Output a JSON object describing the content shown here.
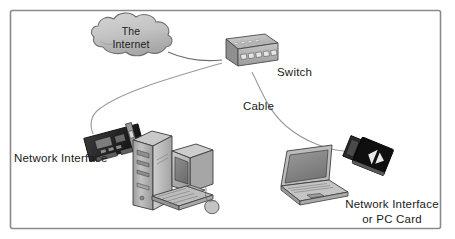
{
  "figure": {
    "frame": {
      "border_color": "#8a8a8a",
      "background": "#ffffff"
    },
    "labels": {
      "cloud_line1": "The",
      "cloud_line2": "Internet",
      "switch": "Switch",
      "cable": "Cable",
      "network_interface": "Network Interface",
      "pc_card_line1": "Network Interface",
      "pc_card_line2": "or PC Card"
    },
    "nodes": [
      {
        "id": "internet-cloud",
        "name": "The Internet",
        "type": "cloud",
        "fill": "#c5c5c5",
        "stroke": "#6e6e6e"
      },
      {
        "id": "switch",
        "name": "Switch",
        "type": "network-switch",
        "ports": 5,
        "leds": 4,
        "fill": "#b8b8b8",
        "stroke": "#4a4a4a"
      },
      {
        "id": "nic-card",
        "name": "Network Interface Card",
        "type": "expansion-card",
        "fill": "#2b2b2b",
        "stroke": "#111111"
      },
      {
        "id": "desktop-tower",
        "name": "Desktop computer tower",
        "type": "computer-tower",
        "fill": "#b0b0b0",
        "stroke": "#3d3d3d"
      },
      {
        "id": "crt-monitor",
        "name": "CRT monitor",
        "type": "monitor",
        "fill": "#bcbcbc",
        "stroke": "#3d3d3d"
      },
      {
        "id": "keyboard",
        "name": "Keyboard",
        "type": "keyboard",
        "fill": "#b5b5b5",
        "stroke": "#3d3d3d"
      },
      {
        "id": "mouse",
        "name": "Mouse",
        "type": "mouse",
        "fill": "#c0c0c0",
        "stroke": "#3d3d3d"
      },
      {
        "id": "laptop",
        "name": "Laptop computer",
        "type": "laptop",
        "fill": "#b4b4b4",
        "stroke": "#3d3d3d"
      },
      {
        "id": "pc-card",
        "name": "PC Card network adapter",
        "type": "pc-card",
        "fill": "#101010",
        "stroke": "#000000"
      }
    ],
    "links": [
      {
        "id": "cloud-to-switch",
        "from": "internet-cloud",
        "to": "switch",
        "style": "curve",
        "color": "#6e6e6e"
      },
      {
        "id": "switch-to-nic",
        "from": "switch",
        "to": "nic-card",
        "style": "curve",
        "color": "#8a8a8a"
      },
      {
        "id": "switch-to-pccard",
        "from": "switch",
        "to": "pc-card",
        "style": "curve",
        "color": "#8a8a8a"
      }
    ]
  }
}
